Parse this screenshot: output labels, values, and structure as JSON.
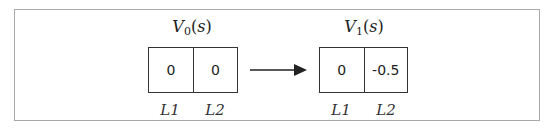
{
  "diagram": {
    "left": {
      "title_main": "V",
      "title_sub": "0",
      "title_arg": "s",
      "cells": [
        {
          "label": "L1",
          "value": "0"
        },
        {
          "label": "L2",
          "value": "0"
        }
      ]
    },
    "right": {
      "title_main": "V",
      "title_sub": "1",
      "title_arg": "s",
      "cells": [
        {
          "label": "L1",
          "value": "0"
        },
        {
          "label": "L2",
          "value": "-0.5"
        }
      ]
    },
    "arrow": {
      "direction": "right",
      "icon": "arrow-right-icon"
    },
    "colors": {
      "border": "#333333",
      "frame": "#a9a9a9",
      "text": "#222222"
    }
  }
}
